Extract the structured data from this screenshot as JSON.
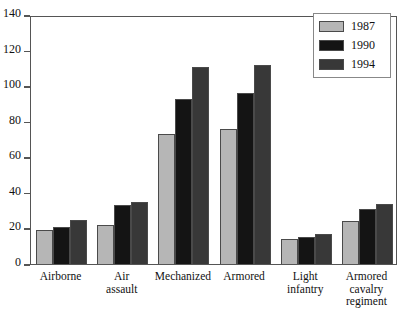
{
  "chart_data": {
    "type": "bar",
    "title": "",
    "subtitle": "",
    "xlabel": "",
    "ylabel": "",
    "ylim": [
      0,
      140
    ],
    "ytick_step": 20,
    "yticks": [
      0,
      20,
      40,
      60,
      80,
      100,
      120,
      140
    ],
    "grid": false,
    "legend_position": "top-right",
    "categories": [
      "Airborne",
      "Air\nassault",
      "Mechanized",
      "Armored",
      "Light\ninfantry",
      "Armored\ncavalry\nregiment"
    ],
    "series": [
      {
        "name": "1987",
        "color": "#b6b6b6",
        "values": [
          19,
          22,
          73,
          76,
          14,
          24
        ]
      },
      {
        "name": "1990",
        "color": "#141414",
        "values": [
          21,
          33,
          93,
          96,
          15,
          31
        ]
      },
      {
        "name": "1994",
        "color": "#383838",
        "values": [
          25,
          35,
          111,
          112,
          17,
          34
        ]
      }
    ]
  },
  "legend": {
    "entries": [
      {
        "label": "1987",
        "swatch": "s1987"
      },
      {
        "label": "1990",
        "swatch": "s1990"
      },
      {
        "label": "1994",
        "swatch": "s1994"
      }
    ]
  },
  "axis": {
    "frame_color": "#555555"
  }
}
